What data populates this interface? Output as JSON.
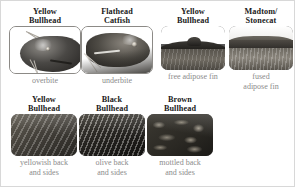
{
  "figure": {
    "name": "catfish-identification-chart",
    "rows": [
      {
        "id": "row-top",
        "cards": [
          {
            "title": "Yellow\nBullhead",
            "caption": "overbite",
            "photo": "yellow-bullhead-head-photo",
            "style": "headshot-outlined"
          },
          {
            "title": "Flathead\nCatfish",
            "caption": "underbite",
            "photo": "flathead-catfish-head-photo",
            "style": "headshot-outlined"
          },
          {
            "title": "Yellow\nBullhead",
            "caption": "free adipose fin",
            "photo": "yellow-bullhead-adipose-fin-photo",
            "style": "finshot"
          },
          {
            "title": "Madtom/\nStonecat",
            "caption": "fused\nadipose fin",
            "photo": "madtom-stonecat-adipose-fin-photo",
            "style": "finshot"
          }
        ]
      },
      {
        "id": "row-bottom",
        "cards": [
          {
            "title": "Yellow\nBullhead",
            "caption": "yellowish back\nand sides",
            "photo": "yellow-bullhead-flank-photo",
            "style": "flank-yellow"
          },
          {
            "title": "Black\nBullhead",
            "caption": "olive back\nand sides",
            "photo": "black-bullhead-flank-photo",
            "style": "flank-black"
          },
          {
            "title": "Brown\nBullhead",
            "caption": "mottled back\nand sides",
            "photo": "brown-bullhead-flank-photo",
            "style": "flank-brown"
          }
        ]
      }
    ],
    "colors": {
      "title_text": "#1a1a1a",
      "caption_text": "#8b8b8b",
      "background": "#ffffff",
      "photo_border": "#8c8a86",
      "figure_border": "#d8d8d8"
    }
  }
}
